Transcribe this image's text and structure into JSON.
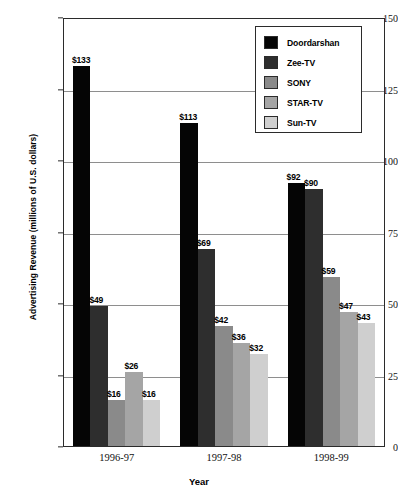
{
  "chart_data": {
    "type": "bar",
    "title": "",
    "xlabel": "Year",
    "ylabel": "Advertising Revenue (millions of U.S. dollars)",
    "categories": [
      "1996-97",
      "1997-98",
      "1998-99"
    ],
    "ylim": [
      0,
      150
    ],
    "yticks": [
      0,
      25,
      50,
      75,
      100,
      125,
      150
    ],
    "ytick_labels": [
      "0",
      "25",
      "50",
      "75",
      "100",
      "125",
      "150"
    ],
    "grid": true,
    "legend_position": "top-right",
    "series": [
      {
        "name": "Doordarshan",
        "color": "#050505",
        "values": [
          133,
          113,
          92
        ],
        "labels": [
          "$133",
          "$113",
          "$92"
        ]
      },
      {
        "name": "Zee-TV",
        "color": "#2e2e2e",
        "values": [
          49,
          69,
          90
        ],
        "labels": [
          "$49",
          "$69",
          "$90"
        ]
      },
      {
        "name": "SONY",
        "color": "#8a8a8a",
        "values": [
          16,
          42,
          59
        ],
        "labels": [
          "$16",
          "$42",
          "$59"
        ]
      },
      {
        "name": "STAR-TV",
        "color": "#a5a5a5",
        "values": [
          26,
          36,
          47
        ],
        "labels": [
          "$26",
          "$36",
          "$47"
        ]
      },
      {
        "name": "Sun-TV",
        "color": "#cfcfcf",
        "values": [
          16,
          32,
          43
        ],
        "labels": [
          "$16",
          "$32",
          "$43"
        ]
      }
    ]
  }
}
